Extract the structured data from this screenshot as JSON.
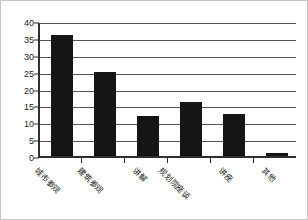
{
  "chart_data": {
    "type": "bar",
    "title": "",
    "xlabel": "",
    "ylabel": "",
    "categories": [
      "城市参观",
      "建筑参观",
      "讲解",
      "规划院座谈",
      "讲座",
      "其他"
    ],
    "values": [
      36,
      25,
      12,
      16,
      12.5,
      1
    ],
    "ylim": [
      0,
      40
    ],
    "ytick_labels": [
      "0",
      "5",
      "10",
      "15",
      "20",
      "25",
      "30",
      "35",
      "40"
    ],
    "ytick_values": [
      0,
      5,
      10,
      15,
      20,
      25,
      30,
      35,
      40
    ],
    "grid": "horizontal",
    "legend": "none",
    "bar_color": "#151515",
    "axis_color": "#2f2f2f",
    "gridline_color": "#555555",
    "background_color": "#ffffff",
    "border_color": "#c8c8c8"
  }
}
